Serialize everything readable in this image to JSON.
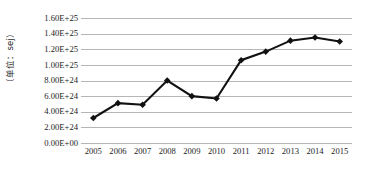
{
  "chart_data": {
    "type": "line",
    "title": "",
    "xlabel": "",
    "ylabel": "（单位：sej）",
    "categories": [
      "2005",
      "2006",
      "2007",
      "2008",
      "2009",
      "2010",
      "2011",
      "2012",
      "2013",
      "2014",
      "2015"
    ],
    "values": [
      3.2e+24,
      5.1e+24,
      4.9e+24,
      8e+24,
      6e+24,
      5.7e+24,
      1.06e+25,
      1.17e+25,
      1.31e+25,
      1.35e+25,
      1.3e+25
    ],
    "series": [
      {
        "name": "",
        "values": [
          3.2e+24,
          5.1e+24,
          4.9e+24,
          8e+24,
          6e+24,
          5.7e+24,
          1.06e+25,
          1.17e+25,
          1.31e+25,
          1.35e+25,
          1.3e+25
        ]
      }
    ],
    "ylim": [
      0,
      1.6e+25
    ],
    "ytick_values": [
      0,
      2e+24,
      4e+24,
      6e+24,
      8e+24,
      1e+25,
      1.2e+25,
      1.4e+25,
      1.6e+25
    ],
    "ytick_labels": [
      "0.00E+00",
      "2.00E+24",
      "4.00E+24",
      "6.00E+24",
      "8.00E+24",
      "1.00E+25",
      "1.20E+25",
      "1.40E+25",
      "1.60E+25"
    ],
    "grid": true,
    "grid_axis": "y",
    "legend": false,
    "legend_position": "none",
    "marker": "diamond",
    "line_color": "#111111",
    "marker_color": "#111111",
    "grid_color": "#b6b6b6",
    "background_color": "#ffffff"
  }
}
